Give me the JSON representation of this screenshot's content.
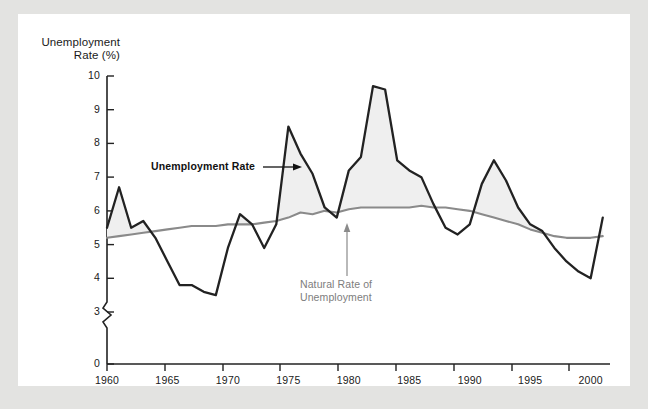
{
  "figure": {
    "background_color": "#e3e3e1",
    "panel_color": "#ffffff"
  },
  "axis_titles": {
    "y_title": "Unemployment\nRate (%)"
  },
  "annotations": {
    "unemployment_label": "Unemployment Rate",
    "natural_label": "Natural Rate of\nUnemployment"
  },
  "chart_data": {
    "type": "line",
    "title": "",
    "subtitle": "",
    "xlabel": "",
    "ylabel": "Unemployment Rate (%)",
    "xlim": [
      1960,
      2001.6
    ],
    "ylim": [
      3,
      10
    ],
    "y_axis_break": true,
    "y_axis_break_note": "axis broken between 0 and 3",
    "grid": false,
    "legend": "inline annotations",
    "x_ticks": [
      1960,
      1965,
      1970,
      1975,
      1980,
      1985,
      1990,
      1995,
      2000
    ],
    "y_ticks": [
      0,
      3,
      4,
      5,
      6,
      7,
      8,
      9,
      10
    ],
    "fill_between_note": "light gray shading where unemployment rate exceeds natural rate",
    "fill_color": "#efefef",
    "series": [
      {
        "name": "Unemployment Rate",
        "color": "#222222",
        "x": [
          1960,
          1961,
          1962,
          1963,
          1964,
          1965,
          1966,
          1967,
          1968,
          1969,
          1970,
          1971,
          1972,
          1973,
          1974,
          1975,
          1976,
          1977,
          1978,
          1979,
          1980,
          1981,
          1982,
          1983,
          1984,
          1985,
          1986,
          1987,
          1988,
          1989,
          1990,
          1991,
          1992,
          1993,
          1994,
          1995,
          1996,
          1997,
          1998,
          1999,
          2000,
          2001
        ],
        "values": [
          5.5,
          6.7,
          5.5,
          5.7,
          5.2,
          4.5,
          3.8,
          3.8,
          3.6,
          3.5,
          4.9,
          5.9,
          5.6,
          4.9,
          5.6,
          8.5,
          7.7,
          7.1,
          6.1,
          5.8,
          7.2,
          7.6,
          9.7,
          9.6,
          7.5,
          7.2,
          7.0,
          6.2,
          5.5,
          5.3,
          5.6,
          6.8,
          7.5,
          6.9,
          6.1,
          5.6,
          5.4,
          4.9,
          4.5,
          4.2,
          4.0,
          5.8
        ]
      },
      {
        "name": "Natural Rate of Unemployment",
        "color": "#8a8a8a",
        "x": [
          1960,
          1961,
          1962,
          1963,
          1964,
          1965,
          1966,
          1967,
          1968,
          1969,
          1970,
          1971,
          1972,
          1973,
          1974,
          1975,
          1976,
          1977,
          1978,
          1979,
          1980,
          1981,
          1982,
          1983,
          1984,
          1985,
          1986,
          1987,
          1988,
          1989,
          1990,
          1991,
          1992,
          1993,
          1994,
          1995,
          1996,
          1997,
          1998,
          1999,
          2000,
          2001
        ],
        "values": [
          5.2,
          5.25,
          5.3,
          5.35,
          5.4,
          5.45,
          5.5,
          5.55,
          5.55,
          5.55,
          5.6,
          5.6,
          5.6,
          5.65,
          5.7,
          5.8,
          5.95,
          5.9,
          6.0,
          5.95,
          6.05,
          6.1,
          6.1,
          6.1,
          6.1,
          6.1,
          6.15,
          6.1,
          6.1,
          6.05,
          6.0,
          5.9,
          5.8,
          5.7,
          5.6,
          5.45,
          5.35,
          5.25,
          5.2,
          5.2,
          5.2,
          5.25
        ]
      }
    ]
  }
}
